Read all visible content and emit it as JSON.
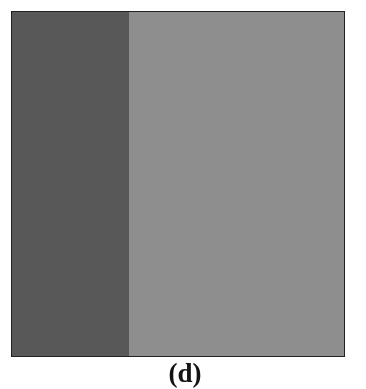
{
  "figure": {
    "caption": "(d)",
    "panel_label": "d",
    "background_color": "#ffffff",
    "border_color": "#23211f"
  },
  "image_panel": {
    "name": "noisy-two-region-image",
    "description": "Grayscale noisy synthetic image with two uniform-intensity regions separated by a slanted boundary",
    "x": 11,
    "y": 11,
    "width": 334,
    "height": 346,
    "regions": [
      {
        "name": "dark-region",
        "position": "left",
        "mean_gray": 88,
        "mean_gray_hex": "#585858",
        "noise_sigma": 34
      },
      {
        "name": "light-region",
        "position": "right",
        "mean_gray": 142,
        "mean_gray_hex": "#8e8e8e",
        "noise_sigma": 34
      }
    ],
    "boundary": {
      "name": "slanted-edge",
      "type": "line",
      "top_x_fraction": 0.35,
      "bottom_x_fraction": 0.59,
      "top_x_px": 117,
      "bottom_x_px": 197
    },
    "noise": {
      "type": "gaussian",
      "seed": 20240517,
      "grain_px": 1
    }
  }
}
